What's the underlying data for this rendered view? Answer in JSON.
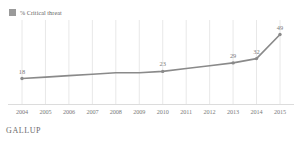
{
  "legend": {
    "swatch_icon": "legend-swatch-icon",
    "label": "% Critical threat",
    "color": "#9a9a9a"
  },
  "footer": {
    "brand": "GALLUP"
  },
  "style": {
    "line_color": "#8a8a8a",
    "marker_color": "#8a8a8a",
    "gridline_color": "#e8e8e8",
    "axis_color": "#dcdcdc",
    "background": "#ffffff",
    "label_color": "#7b7b7b"
  },
  "chart_data": {
    "type": "line",
    "title": "",
    "subtitle": "",
    "xlabel": "",
    "ylabel": "",
    "grid": "vertical-only",
    "legend_position": "top-left",
    "categories": [
      "2004",
      "2005",
      "2006",
      "2007",
      "2008",
      "2009",
      "2010",
      "2011",
      "2012",
      "2013",
      "2014",
      "2015"
    ],
    "xlim": [
      2004,
      2015
    ],
    "ylim": [
      0,
      55
    ],
    "series": [
      {
        "name": "% Critical threat",
        "color": "#8a8a8a",
        "values": [
          18,
          19,
          20,
          21,
          22,
          22,
          23,
          25,
          27,
          29,
          32,
          49
        ],
        "point_labels": [
          "18",
          "",
          "",
          "",
          "",
          "",
          "23",
          "",
          "",
          "29",
          "32",
          "49"
        ],
        "markers_at": [
          "2004",
          "2010",
          "2013",
          "2014",
          "2015"
        ]
      }
    ],
    "data_labels": [
      {
        "category": "2004",
        "value": 18,
        "text": "18"
      },
      {
        "category": "2010",
        "value": 23,
        "text": "23"
      },
      {
        "category": "2013",
        "value": 29,
        "text": "29"
      },
      {
        "category": "2014",
        "value": 32,
        "text": "32"
      },
      {
        "category": "2015",
        "value": 49,
        "text": "49"
      }
    ]
  }
}
